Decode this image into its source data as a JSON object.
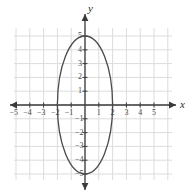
{
  "figure": {
    "kind": "coordinate-plane-with-ellipse",
    "width": 193,
    "height": 193,
    "background_color": "#ffffff"
  },
  "axes": {
    "x_letter": "x",
    "y_letter": "y",
    "axis_color": "#3a3a3a",
    "grid_color": "#dcdcdc",
    "origin_px": {
      "x": 85,
      "y": 105
    },
    "unit_px": 13.8,
    "x_tick_labels": [
      "−5",
      "−4",
      "−3",
      "−2",
      "−1",
      "1",
      "2",
      "3",
      "4",
      "5"
    ],
    "x_tick_values": [
      -5,
      -4,
      -3,
      -2,
      -1,
      1,
      2,
      3,
      4,
      5
    ],
    "y_tick_labels": [
      "5",
      "4",
      "3",
      "2",
      "1",
      "−1",
      "−2",
      "−3",
      "−4",
      "−5"
    ],
    "y_tick_values": [
      5,
      4,
      3,
      2,
      1,
      -1,
      -2,
      -3,
      -4,
      -5
    ],
    "grid_bounds_px": {
      "left": 14,
      "top": 28,
      "right": 172,
      "bottom": 180
    },
    "grid": "on"
  },
  "chart_data": {
    "type": "scatter",
    "title": "",
    "xlabel": "x",
    "ylabel": "y",
    "xlim": [
      -5.5,
      6.5
    ],
    "ylim": [
      -5.5,
      5.5
    ],
    "grid": true,
    "legend": "none",
    "curves": [
      {
        "name": "ellipse",
        "equation": "x^2/4 + y^2/25 = 1",
        "center": [
          0,
          0
        ],
        "semi_axis_x": 2,
        "semi_axis_y": 5,
        "orientation": "vertical-major",
        "stroke_color": "#4a4a4a",
        "stroke_width": 1.3,
        "fill": "none",
        "vertices": [
          [
            0,
            5
          ],
          [
            0,
            -5
          ]
        ],
        "co_vertices": [
          [
            -2,
            0
          ],
          [
            2,
            0
          ]
        ]
      }
    ]
  }
}
